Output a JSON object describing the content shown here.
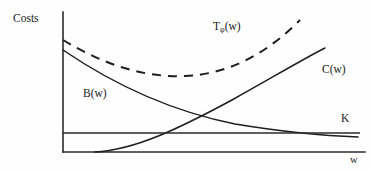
{
  "figure": {
    "title": "",
    "background_color": "#fefefe",
    "line_color": "#1d1d1d",
    "axis_color": "#2b2b2b"
  },
  "labels": {
    "y_axis": "Costs",
    "x_axis": "w",
    "total_cost_base": "T",
    "total_cost_subscript": "φ",
    "total_cost_arg": "(w)",
    "benefit_curve": "B(w)",
    "cost_curve": "C(w)",
    "constant_line": "K"
  },
  "chart_data": {
    "type": "line",
    "title": "",
    "xlabel": "w",
    "ylabel": "Costs",
    "xlim": [
      0,
      100
    ],
    "ylim": [
      0,
      100
    ],
    "grid": false,
    "legend": "inline-annotations",
    "axis_style": "two-axis-no-ticks",
    "series": [
      {
        "name": "Tφ(w)",
        "label": "Tφ(w)",
        "style": "dashed",
        "shape": "u-shaped-convex",
        "x": [
          0,
          10,
          20,
          30,
          40,
          50,
          60,
          70,
          80
        ],
        "y": [
          80,
          70,
          62,
          56,
          53,
          55,
          62,
          74,
          89
        ],
        "minimum_x": 40,
        "minimum_y": 53,
        "path": "M 63 40 C 100 62 140 78 185 76 C 235 74 272 48 300 20"
      },
      {
        "name": "B(w)",
        "label": "B(w)",
        "style": "solid",
        "shape": "decreasing-convex",
        "x": [
          0,
          10,
          20,
          30,
          40,
          50,
          60,
          70,
          80,
          90,
          100
        ],
        "y": [
          73,
          62,
          52,
          43,
          35,
          28,
          23,
          19,
          15,
          12,
          10
        ],
        "path": "M 63 50 C 110 82 165 110 235 124 C 290 133 330 136 358 137"
      },
      {
        "name": "C(w)",
        "label": "C(w)",
        "style": "solid",
        "shape": "increasing-convex",
        "x": [
          11,
          20,
          30,
          40,
          50,
          60,
          70,
          80,
          90
        ],
        "y": [
          0,
          4,
          10,
          19,
          30,
          42,
          55,
          68,
          75
        ],
        "path": "M 95 152 C 135 150 180 128 232 100 C 275 76 305 58 325 48"
      },
      {
        "name": "K",
        "label": "K",
        "style": "solid-horizontal",
        "shape": "constant",
        "value_y": 12,
        "path": "M 63 133 L 360 133"
      }
    ],
    "annotations": [
      {
        "text": "Costs",
        "x_px": 13,
        "y_px": 13,
        "role": "y-axis-label"
      },
      {
        "text": "Tφ(w)",
        "x_px": 213,
        "y_px": 21,
        "role": "series-label"
      },
      {
        "text": "B(w)",
        "x_px": 83,
        "y_px": 88,
        "role": "series-label"
      },
      {
        "text": "C(w)",
        "x_px": 322,
        "y_px": 64,
        "role": "series-label"
      },
      {
        "text": "K",
        "x_px": 341,
        "y_px": 113,
        "role": "series-label"
      },
      {
        "text": "w",
        "x_px": 350,
        "y_px": 155,
        "role": "x-axis-label"
      }
    ],
    "axes_geometry": {
      "y_axis_path": "M 63 12 L 63 152",
      "x_axis_path": "M 63 152 L 365 152"
    }
  }
}
